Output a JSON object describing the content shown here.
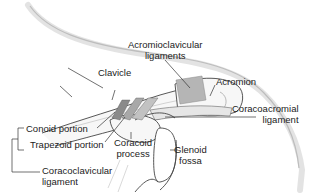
{
  "diagram": {
    "labels": {
      "acromioclavicular": [
        "Acromioclavicular",
        "ligaments"
      ],
      "clavicle": "Clavicle",
      "acromion": "Acromion",
      "coracoacromial": [
        "Coracoacromial",
        "ligament"
      ],
      "conoid": "Conoid portion",
      "trapezoid": "Trapezoid portion",
      "coracoid": [
        "Coracoid",
        "process"
      ],
      "glenoid": [
        "Glenoid",
        "fossa"
      ],
      "coracoclavicular": [
        "Coracoclavicular",
        "ligament"
      ]
    },
    "colors": {
      "outline": "#333333",
      "ligament_fill": "#bdbdbd",
      "ligament_dark": "#8a8a8a",
      "shadow": "#d9d9d9",
      "text": "#222222"
    }
  }
}
